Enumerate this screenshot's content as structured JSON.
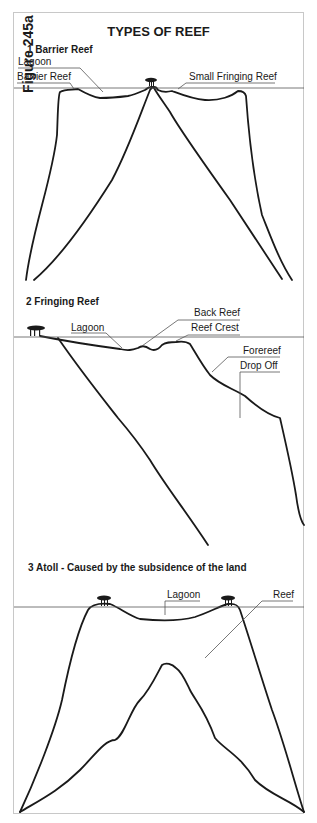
{
  "figure_label": "Figure 245a",
  "title": "TYPES OF REEF",
  "sections": [
    {
      "heading": "1  Barrier Reef",
      "labels": [
        "Lagoon",
        "Barrier Reef",
        "Small Fringing Reef"
      ]
    },
    {
      "heading": "2  Fringing Reef",
      "labels": [
        "Back Reef",
        "Lagoon",
        "Reef Crest",
        "Forereef",
        "Drop Off"
      ]
    },
    {
      "heading": "3  Atoll - Caused by the subsidence of the land",
      "labels": [
        "Lagoon",
        "Reef"
      ]
    }
  ],
  "colors": {
    "line": "#1a1a1a",
    "leader": "#555555",
    "frame": "#c8c8c8"
  }
}
